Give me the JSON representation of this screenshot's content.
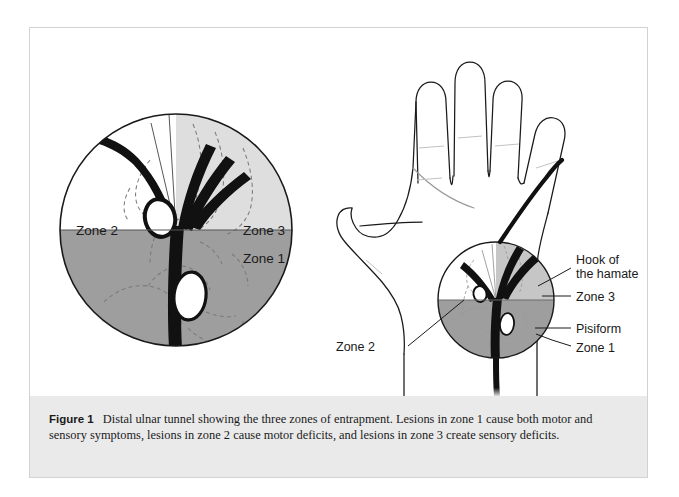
{
  "figure": {
    "label": "Figure 1",
    "caption": "Distal ulnar tunnel showing the three zones of entrapment. Lesions in zone 1 cause both motor and sensory symptoms, lesions in zone 2 cause motor deficits, and lesions in zone 3 create sensory deficits."
  },
  "colors": {
    "zone1_fill": "#9e9e9e",
    "zone2_fill": "#ffffff",
    "zone3_fill": "#dedede",
    "outline": "#1a1a1a",
    "nerve": "#111111",
    "dashed_bone": "#7a7a7a",
    "caption_background": "#eaeaea",
    "frame_border": "#d2d2d2",
    "text": "#1a1a1a"
  },
  "left_diagram": {
    "name": "cross-section-detail",
    "zone_labels": [
      {
        "id": "zone2",
        "text": "Zone 2"
      },
      {
        "id": "zone3",
        "text": "Zone 3"
      },
      {
        "id": "zone1",
        "text": "Zone 1"
      }
    ],
    "structures": [
      {
        "id": "hook-of-hamate",
        "shape": "small-oval-outline"
      },
      {
        "id": "pisiform",
        "shape": "large-white-oval"
      },
      {
        "id": "ulnar-nerve-trunk",
        "shape": "thick-vertical-band"
      },
      {
        "id": "ulnar-nerve-branches",
        "count": 4
      }
    ]
  },
  "right_diagram": {
    "name": "hand-palm-overview",
    "callouts": [
      {
        "id": "hook-of-the-hamate",
        "line1": "Hook of",
        "line2": "the hamate"
      },
      {
        "id": "zone3",
        "text": "Zone 3"
      },
      {
        "id": "pisiform",
        "text": "Pisiform"
      },
      {
        "id": "zone1",
        "text": "Zone 1"
      },
      {
        "id": "zone2",
        "text": "Zone 2"
      }
    ]
  }
}
